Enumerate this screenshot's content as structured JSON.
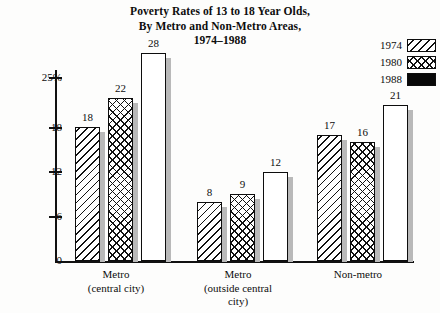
{
  "chart_data": {
    "type": "bar",
    "title": "Poverty Rates of 13 to 18 Year Olds, By Metro and Non-Metro Areas, 1974–1988",
    "title_lines": [
      "Poverty Rates of 13 to 18 Year Olds,",
      "By Metro and Non-Metro Areas,",
      "1974–1988"
    ],
    "categories": [
      "Metro (central city)",
      "Metro (outside central city)",
      "Non-metro"
    ],
    "category_lines": [
      [
        "Metro",
        "(central city)"
      ],
      [
        "Metro",
        "(outside central",
        "city)"
      ],
      [
        "Non-metro"
      ]
    ],
    "series": [
      {
        "name": "1974",
        "pattern": "diagonal-hatch",
        "values": [
          18,
          8,
          17
        ]
      },
      {
        "name": "1980",
        "pattern": "cross-hatch",
        "values": [
          22,
          9,
          16
        ]
      },
      {
        "name": "1988",
        "pattern": "solid-black",
        "values": [
          28,
          12,
          21
        ]
      }
    ],
    "xlabel": "",
    "ylabel": "",
    "ylim": [
      0,
      28.5
    ],
    "yticks": [
      0,
      6,
      12,
      18,
      25
    ],
    "ytick_labels": [
      "0",
      "6",
      "12",
      "18",
      "25%"
    ],
    "grid": false,
    "legend_position": "top-right",
    "legend_entries": [
      "1974",
      "1980",
      "1988"
    ],
    "colors": {
      "ink": "#0d0d0d",
      "bar_fill": "#ffffff",
      "solid_bar": "#080808",
      "shadow": "#b9b9b9",
      "background": "#fdfdfc"
    }
  }
}
